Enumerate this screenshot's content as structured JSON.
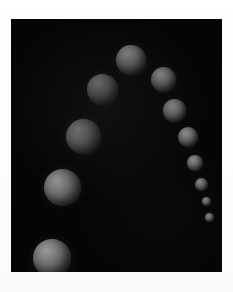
{
  "figure": {
    "background_color": "#050505",
    "paper_color": "#ffffff",
    "sphere_base_color": "#6b6b6b",
    "sphere_highlight_color": "#9a9a97",
    "sphere_shadow_color": "#101010"
  },
  "canvas": {
    "left": 11,
    "top": 19,
    "width": 211,
    "height": 253
  },
  "chart_data": {
    "type": "scatter",
    "xlabel": "",
    "ylabel": "",
    "xlim": [
      0,
      211
    ],
    "ylim": [
      0,
      253
    ],
    "grid": false,
    "legend": null,
    "series": [
      {
        "name": "spheres",
        "points": [
          {
            "id": "sphere-1",
            "cx": 41,
            "cy": 239,
            "r": 19.0
          },
          {
            "id": "sphere-2",
            "cx": 51,
            "cy": 168,
            "r": 18.5
          },
          {
            "id": "sphere-3",
            "cx": 72,
            "cy": 117,
            "r": 17.5
          },
          {
            "id": "sphere-4",
            "cx": 91,
            "cy": 70,
            "r": 15.5
          },
          {
            "id": "sphere-5",
            "cx": 120,
            "cy": 41,
            "r": 15.0
          },
          {
            "id": "sphere-6",
            "cx": 152,
            "cy": 60,
            "r": 12.5
          },
          {
            "id": "sphere-7",
            "cx": 163,
            "cy": 91,
            "r": 11.5
          },
          {
            "id": "sphere-8",
            "cx": 177,
            "cy": 118,
            "r": 10.0
          },
          {
            "id": "sphere-9",
            "cx": 184,
            "cy": 144,
            "r": 8.0
          },
          {
            "id": "sphere-10",
            "cx": 190,
            "cy": 165,
            "r": 6.5
          },
          {
            "id": "sphere-11",
            "cx": 195,
            "cy": 182,
            "r": 4.5
          },
          {
            "id": "sphere-12",
            "cx": 198,
            "cy": 198,
            "r": 4.5
          }
        ]
      }
    ]
  }
}
